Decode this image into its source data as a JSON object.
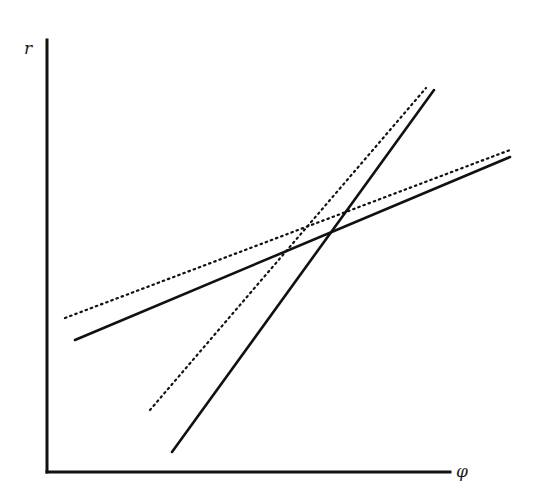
{
  "diagram": {
    "y_axis_label": "r",
    "x_axis_label": "φ",
    "colors": {
      "ink": "#111111",
      "background": "#ffffff"
    },
    "axes": {
      "origin": [
        47,
        472
      ],
      "y_top": [
        47,
        40
      ],
      "x_right": [
        450,
        472
      ]
    },
    "lines": [
      {
        "name": "solid-shallow-line",
        "style": "solid",
        "from": [
          75,
          340
        ],
        "to": [
          510,
          157
        ]
      },
      {
        "name": "dotted-shallow-line",
        "style": "dotted",
        "from": [
          65,
          318
        ],
        "to": [
          510,
          150
        ]
      },
      {
        "name": "solid-steep-line",
        "style": "solid",
        "from": [
          172,
          452
        ],
        "to": [
          434,
          90
        ]
      },
      {
        "name": "dotted-steep-line",
        "style": "dotted",
        "from": [
          150,
          410
        ],
        "to": [
          426,
          88
        ]
      }
    ]
  }
}
